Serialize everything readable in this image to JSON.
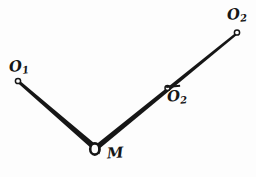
{
  "figure": {
    "background_color": "#fdfdfd",
    "ink_color": "#161616",
    "points": [
      {
        "id": "o1",
        "label_base": "O",
        "label_sub": "1",
        "overbar": false,
        "x": 18,
        "y": 81,
        "marker": "open-circle"
      },
      {
        "id": "m",
        "label_base": "M",
        "label_sub": "",
        "overbar": false,
        "x": 95,
        "y": 148,
        "marker": "ring"
      },
      {
        "id": "o2bar",
        "label_base": "O",
        "label_sub": "2",
        "overbar": true,
        "x": 167,
        "y": 88,
        "marker": "open-circle"
      },
      {
        "id": "o2top",
        "label_base": "O",
        "label_sub": "2",
        "overbar": false,
        "x": 237,
        "y": 32,
        "marker": "open-circle"
      }
    ],
    "segments": [
      {
        "id": "o1-m",
        "from": "o1",
        "to": "m"
      },
      {
        "id": "m-o2",
        "from": "m",
        "to": "o2top"
      }
    ],
    "labels": {
      "o1": {
        "base": "O",
        "sub": "1"
      },
      "o2top": {
        "base": "O",
        "sub": "2"
      },
      "o2bar": {
        "base": "O",
        "sub": "2"
      },
      "m": {
        "base": "M",
        "sub": ""
      }
    }
  }
}
